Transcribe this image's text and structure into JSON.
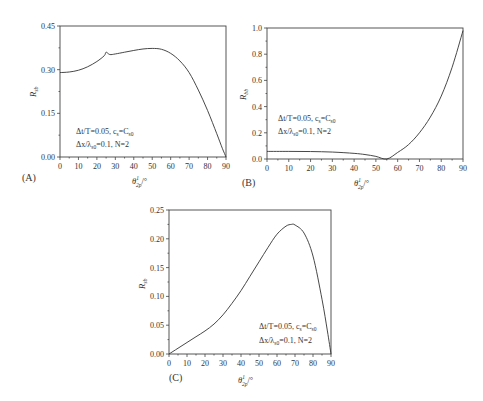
{
  "chart_data": [
    {
      "panel": "(A)",
      "type": "line",
      "xlabel": "θ¹₂p/°",
      "ylabel": "R_sb",
      "xlim": [
        0,
        90
      ],
      "ylim": [
        0,
        0.45
      ],
      "xticks": [
        0,
        10,
        20,
        30,
        40,
        50,
        60,
        70,
        80,
        90
      ],
      "yticks": [
        "0.00",
        "0.15",
        "0.30",
        "0.45"
      ],
      "annotation": [
        "Δt/T=0.05, c_s=C_s0",
        "Δx/λ_s0=0.1, N=2"
      ],
      "x": [
        0,
        5,
        10,
        15,
        20,
        24,
        25,
        27,
        30,
        35,
        40,
        45,
        50,
        55,
        60,
        65,
        70,
        75,
        80,
        85,
        88,
        90
      ],
      "values": [
        0.29,
        0.292,
        0.298,
        0.31,
        0.328,
        0.348,
        0.36,
        0.352,
        0.354,
        0.36,
        0.366,
        0.371,
        0.373,
        0.37,
        0.356,
        0.33,
        0.29,
        0.23,
        0.16,
        0.08,
        0.03,
        0.0
      ]
    },
    {
      "panel": "(B)",
      "type": "line",
      "xlabel": "θ¹₂p/°",
      "ylabel": "R_bb",
      "xlim": [
        0,
        90
      ],
      "ylim": [
        0,
        1.0
      ],
      "xticks": [
        0,
        10,
        20,
        30,
        40,
        50,
        60,
        70,
        80,
        90
      ],
      "yticks": [
        "0.0",
        "0.2",
        "0.4",
        "0.6",
        "0.8",
        "1.0"
      ],
      "annotation": [
        "Δt/T=0.05, c_s=C_s0",
        "Δx/λ_s0=0.1, N=2"
      ],
      "x": [
        0,
        10,
        20,
        30,
        40,
        45,
        50,
        55,
        60,
        65,
        70,
        75,
        80,
        85,
        90
      ],
      "values": [
        0.058,
        0.058,
        0.057,
        0.053,
        0.043,
        0.034,
        0.02,
        0.0,
        0.05,
        0.11,
        0.2,
        0.32,
        0.48,
        0.7,
        0.98
      ]
    },
    {
      "panel": "(C)",
      "type": "line",
      "xlabel": "θ¹₂p/°",
      "ylabel": "R_sb",
      "xlim": [
        0,
        90
      ],
      "ylim": [
        0,
        0.25
      ],
      "xticks": [
        0,
        10,
        20,
        30,
        40,
        50,
        60,
        70,
        80,
        90
      ],
      "yticks": [
        "0.00",
        "0.05",
        "0.10",
        "0.15",
        "0.20",
        "0.25"
      ],
      "annotation": [
        "Δt/T=0.05, c_s=C_s0",
        "Δx/λ_s0=0.1, N=2"
      ],
      "x": [
        0,
        5,
        10,
        15,
        20,
        25,
        30,
        35,
        40,
        45,
        50,
        55,
        60,
        65,
        68,
        70,
        75,
        80,
        85,
        88,
        90
      ],
      "values": [
        0.0,
        0.01,
        0.02,
        0.03,
        0.04,
        0.052,
        0.068,
        0.088,
        0.11,
        0.135,
        0.16,
        0.185,
        0.208,
        0.222,
        0.225,
        0.224,
        0.21,
        0.17,
        0.095,
        0.04,
        0.0
      ]
    }
  ],
  "panels": {
    "a": {
      "label": "(A)",
      "ylabel": "R",
      "ylabel_sub": "sb",
      "ann1": "Δt/T=0.05, c",
      "ann1_sub": "s",
      "ann1_tail": "=C",
      "ann1_tail_sub": "s0",
      "ann2": "Δx/λ",
      "ann2_sub": "s0",
      "ann2_tail": "=0.1, N=2"
    },
    "b": {
      "label": "(B)",
      "ylabel": "R",
      "ylabel_sub": "bb",
      "ann1": "Δt/T=0.05, c",
      "ann1_sub": "s",
      "ann1_tail": "=C",
      "ann1_tail_sub": "s0",
      "ann2": "Δx/λ",
      "ann2_sub": "s0",
      "ann2_tail": "=0.1, N=2"
    },
    "c": {
      "label": "(C)",
      "ylabel": "R",
      "ylabel_sub": "sb",
      "ann1": "Δt/T=0.05, c",
      "ann1_sub": "s",
      "ann1_tail": "=C",
      "ann1_tail_sub": "s0",
      "ann2": "Δx/λ",
      "ann2_sub": "s0",
      "ann2_tail": "=0.1, N=2"
    }
  },
  "xaxis_title": {
    "theta": "θ",
    "sup": "1",
    "sub": "2p",
    "unit": "/°"
  }
}
